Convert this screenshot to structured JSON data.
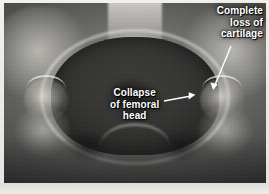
{
  "figure": {
    "kind": "radiograph",
    "modality": "x-ray",
    "view": "anteroposterior pelvis",
    "frame_color": "#ece9e3",
    "annotation_color": "#ffffff"
  },
  "annotations": [
    {
      "id": "cartilage",
      "name": "complete-loss-of-cartilage",
      "text": "Complete\nloss of\ncartilage",
      "lines": [
        "Complete",
        "loss of",
        "cartilage"
      ],
      "position": "top-right",
      "leader": {
        "from": {
          "x": 232,
          "y": 47
        },
        "to": {
          "x": 213,
          "y": 88
        },
        "arrow": true
      }
    },
    {
      "id": "collapse",
      "name": "collapse-of-femoral-head",
      "text": "Collapse\nof femoral\nhead",
      "lines": [
        "Collapse",
        "of femoral",
        "head"
      ],
      "position": "center",
      "leader": {
        "from": {
          "x": 163,
          "y": 101
        },
        "to": {
          "x": 194,
          "y": 95
        },
        "arrow": true
      }
    }
  ],
  "anatomy": {
    "structures": [
      "lumbar spine",
      "sacrum",
      "iliac wing left",
      "iliac wing right",
      "pelvic brim",
      "femoral head left",
      "femoral head right",
      "femoral neck left",
      "femoral neck right",
      "obturator foramen left",
      "obturator foramen right",
      "pubic symphysis"
    ]
  }
}
